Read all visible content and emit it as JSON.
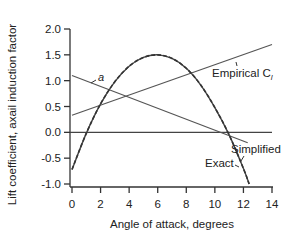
{
  "chart_data": {
    "type": "line",
    "title": "",
    "xlabel": "Angle of attack, degrees",
    "ylabel": "Lift coefficient, axail induction factor",
    "xlim": [
      0,
      14
    ],
    "ylim": [
      -1.0,
      2.0
    ],
    "x_ticks": [
      "0",
      "2",
      "4",
      "6",
      "8",
      "10",
      "12",
      "14"
    ],
    "y_ticks": [
      "2.0",
      "1.5",
      "1.0",
      "0.5",
      "0.0",
      "-0.5",
      "-1.0"
    ],
    "grid": false,
    "series": [
      {
        "name": "a",
        "label": "a",
        "x": [
          0,
          12.3
        ],
        "y": [
          1.1,
          -0.2
        ]
      },
      {
        "name": "Empirical Cl",
        "label": "Empirical C",
        "label_sub": "l",
        "x": [
          0,
          14
        ],
        "y": [
          0.33,
          1.7
        ]
      },
      {
        "name": "Simplified",
        "label": "Simplified",
        "x": [
          0,
          1,
          2,
          3,
          4,
          5,
          6,
          7,
          8,
          9,
          10,
          11,
          12,
          12.4
        ],
        "y": [
          -0.72,
          -0.02,
          0.55,
          0.98,
          1.28,
          1.45,
          1.5,
          1.43,
          1.24,
          0.92,
          0.48,
          -0.05,
          -0.7,
          -1.0
        ]
      },
      {
        "name": "Exact",
        "label": "Exact",
        "x": [
          0,
          1,
          2,
          3,
          4,
          5,
          6,
          7,
          8,
          9,
          10,
          11,
          12,
          12.4
        ],
        "y": [
          -0.72,
          -0.02,
          0.55,
          0.98,
          1.28,
          1.45,
          1.5,
          1.43,
          1.24,
          0.92,
          0.48,
          -0.05,
          -0.7,
          -1.0
        ]
      }
    ],
    "zero_line": true
  }
}
